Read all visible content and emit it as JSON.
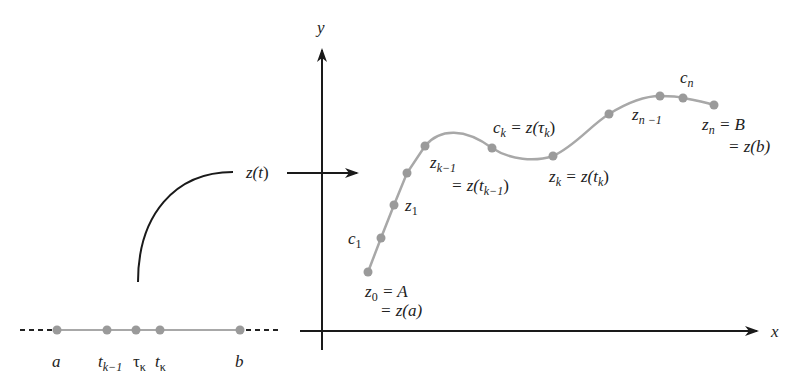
{
  "axes": {
    "x_label": "x",
    "y_label": "y"
  },
  "mapping": {
    "label": "z(t)",
    "label_parts": {
      "func": "z(",
      "var": "t",
      "close": ")"
    }
  },
  "parameter_interval": {
    "points": [
      {
        "name": "a",
        "x": 57
      },
      {
        "name": "t_{k-1}",
        "x": 107
      },
      {
        "name": "τ_k",
        "x": 136
      },
      {
        "name": "t_k",
        "x": 160
      },
      {
        "name": "b",
        "x": 240
      }
    ],
    "labels": {
      "a": "a",
      "t": "t",
      "k_minus_1": "k−1",
      "tau": "τ",
      "kappa": "κ",
      "b": "b"
    }
  },
  "curve_points": [
    {
      "name": "z0",
      "x": 368,
      "y": 272
    },
    {
      "name": "c1",
      "x": 381,
      "y": 238
    },
    {
      "name": "z1",
      "x": 394,
      "y": 205
    },
    {
      "name": "z2",
      "x": 407,
      "y": 173
    },
    {
      "name": "z_{k-1}",
      "x": 425,
      "y": 146
    },
    {
      "name": "c_k",
      "x": 492,
      "y": 148
    },
    {
      "name": "z_k",
      "x": 553,
      "y": 156
    },
    {
      "name": "z_{k+1}",
      "x": 609,
      "y": 114
    },
    {
      "name": "z_{n-1}",
      "x": 660,
      "y": 96
    },
    {
      "name": "c_n",
      "x": 683,
      "y": 98
    },
    {
      "name": "z_n",
      "x": 714,
      "y": 105
    }
  ],
  "annotations": {
    "z0_line1": {
      "z": "z",
      "sub": "0",
      "rest": " = A"
    },
    "z0_line2": "= z(a)",
    "c1": {
      "c": "c",
      "sub": "1"
    },
    "z1": {
      "z": "z",
      "sub": "1"
    },
    "zk1_line1": {
      "z": "z",
      "sub": "k−1"
    },
    "zk1_line2": {
      "pre": "= z(t",
      "sub": "k−1",
      "post": ")"
    },
    "ck": {
      "c": "c",
      "sub": "k",
      "mid": " = z(τ",
      "sub2": "k",
      "post": ")"
    },
    "zk": {
      "z": "z",
      "sub": "k",
      "mid": " = z(t",
      "sub2": "k",
      "post": ")"
    },
    "zn1": {
      "z": "z",
      "sub": "n −1"
    },
    "cn": {
      "c": "c",
      "sub": "n"
    },
    "zn_line1": {
      "z": "z",
      "sub": "n",
      "rest": " = B"
    },
    "zn_line2": "= z(b)"
  },
  "colors": {
    "curve": "#a8a8a8",
    "point": "#9a9a9a",
    "axis": "#1a1a1a",
    "text": "#222222"
  }
}
